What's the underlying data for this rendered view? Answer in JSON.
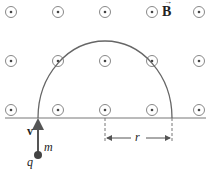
{
  "field": {
    "label": "B",
    "symbol": "field-out-of-page-dot",
    "columns_x": [
      11,
      58,
      105,
      152,
      199
    ],
    "rows_y": [
      12,
      61,
      110
    ]
  },
  "particle": {
    "charge_label": "q",
    "mass_label": "m",
    "velocity_label": "v"
  },
  "radius_label": "r",
  "colors": {
    "line": "#555555",
    "symbol": "#777777",
    "particle": "#444444",
    "text": "#222222"
  }
}
